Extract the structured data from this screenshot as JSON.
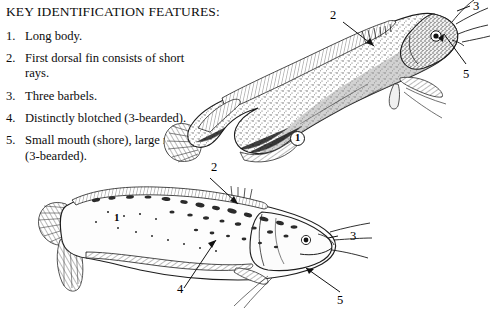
{
  "key": {
    "title": "KEY IDENTIFICATION FEATURES:",
    "items": [
      {
        "number": "1.",
        "text": "Long body."
      },
      {
        "number": "2.",
        "text": "First dorsal fin consists of short rays."
      },
      {
        "number": "3.",
        "text": "Three barbels."
      },
      {
        "number": "4.",
        "text": "Distinctly blotched (3-bearded)."
      },
      {
        "number": "5.",
        "text": "Small mouth (shore), large mouth (3-bearded)."
      }
    ]
  },
  "figures": {
    "top_fish": {
      "name": "shore-rockling-illustration",
      "callouts": [
        {
          "label": "1",
          "style": "halo"
        },
        {
          "label": "2",
          "style": "plain"
        },
        {
          "label": "3",
          "style": "plain"
        },
        {
          "label": "5",
          "style": "plain"
        }
      ]
    },
    "bottom_fish": {
      "name": "three-bearded-rockling-illustration",
      "callouts": [
        {
          "label": "1",
          "style": "plainbold"
        },
        {
          "label": "2",
          "style": "plain"
        },
        {
          "label": "3",
          "style": "plain"
        },
        {
          "label": "4",
          "style": "plain"
        },
        {
          "label": "5",
          "style": "plain"
        }
      ]
    }
  },
  "colors": {
    "ink": "#111111",
    "paper": "#ffffff",
    "body_tone": "#b9b9b9",
    "blotch": "#2b2b2b"
  }
}
